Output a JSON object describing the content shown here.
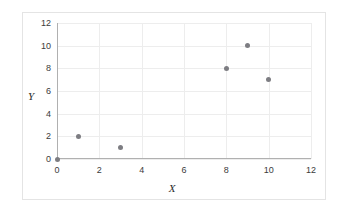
{
  "chart_data": {
    "type": "scatter",
    "title": "",
    "xlabel": "X",
    "ylabel": "Y",
    "xlim": [
      0,
      12
    ],
    "ylim": [
      0,
      12
    ],
    "xticks": [
      0,
      2,
      4,
      6,
      8,
      10,
      12
    ],
    "yticks": [
      0,
      2,
      4,
      6,
      8,
      10,
      12
    ],
    "grid": true,
    "legend": false,
    "marker_color": "#7d7d82",
    "series": [
      {
        "name": "",
        "points": [
          {
            "x": 0,
            "y": 0
          },
          {
            "x": 1,
            "y": 2
          },
          {
            "x": 3,
            "y": 1
          },
          {
            "x": 8,
            "y": 8
          },
          {
            "x": 9,
            "y": 10
          },
          {
            "x": 10,
            "y": 7
          }
        ]
      }
    ]
  }
}
